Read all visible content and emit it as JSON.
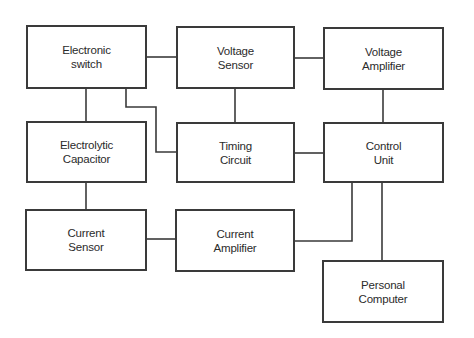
{
  "diagram": {
    "type": "block-diagram",
    "blocks": [
      {
        "id": "electronic_switch",
        "label": "Electronic\nswitch"
      },
      {
        "id": "voltage_sensor",
        "label": "Voltage\nSensor"
      },
      {
        "id": "voltage_amplifier",
        "label": "Voltage\nAmplifier"
      },
      {
        "id": "electrolytic_capacitor",
        "label": "Electrolytic\nCapacitor"
      },
      {
        "id": "timing_circuit",
        "label": "Timing\nCircuit"
      },
      {
        "id": "control_unit",
        "label": "Control\nUnit"
      },
      {
        "id": "current_sensor",
        "label": "Current\nSensor"
      },
      {
        "id": "current_amplifier",
        "label": "Current\nAmplifier"
      },
      {
        "id": "personal_computer",
        "label": "Personal\nComputer"
      }
    ],
    "connections": [
      {
        "from": "electronic_switch",
        "to": "voltage_sensor"
      },
      {
        "from": "voltage_sensor",
        "to": "voltage_amplifier"
      },
      {
        "from": "electronic_switch",
        "to": "electrolytic_capacitor"
      },
      {
        "from": "electronic_switch",
        "to": "timing_circuit"
      },
      {
        "from": "voltage_sensor",
        "to": "timing_circuit"
      },
      {
        "from": "voltage_amplifier",
        "to": "control_unit"
      },
      {
        "from": "timing_circuit",
        "to": "control_unit"
      },
      {
        "from": "electrolytic_capacitor",
        "to": "current_sensor"
      },
      {
        "from": "current_sensor",
        "to": "current_amplifier"
      },
      {
        "from": "current_amplifier",
        "to": "control_unit"
      },
      {
        "from": "control_unit",
        "to": "personal_computer"
      }
    ],
    "colors": {
      "line": "#3a3a3a",
      "text": "#2b2b2b",
      "background": "#ffffff"
    }
  }
}
